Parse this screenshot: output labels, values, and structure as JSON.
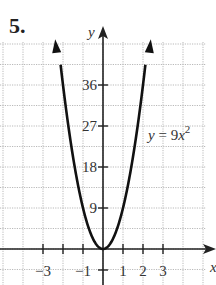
{
  "problem": {
    "number": "5."
  },
  "chart_data": {
    "type": "line",
    "title": "",
    "equation_label": "y = 9x²",
    "equation_parts": {
      "lhs": "y",
      "eq": " = 9",
      "var": "x",
      "exp": "2"
    },
    "xlabel": "x",
    "ylabel": "y",
    "x_ticks": [
      -3,
      -2,
      -1,
      1,
      2,
      3
    ],
    "x_tick_labels": [
      "−3",
      "−1",
      "1",
      "2",
      "3"
    ],
    "y_ticks": [
      9,
      18,
      27,
      36
    ],
    "y_tick_labels": [
      "9",
      "18",
      "27",
      "36"
    ],
    "xlim": [
      -5,
      5
    ],
    "ylim": [
      -4.5,
      45
    ],
    "grid": true,
    "series": [
      {
        "name": "y = 9x^2",
        "function": "9*x^2",
        "x": [
          -2.2,
          -2,
          -1.5,
          -1,
          -0.5,
          0,
          0.5,
          1,
          1.5,
          2,
          2.2
        ],
        "y": [
          43.56,
          36,
          20.25,
          9,
          2.25,
          0,
          2.25,
          9,
          20.25,
          36,
          43.56
        ]
      }
    ],
    "colors": {
      "curve": "#111111",
      "axes": "#222222",
      "grid": "#b9b9b9"
    }
  }
}
